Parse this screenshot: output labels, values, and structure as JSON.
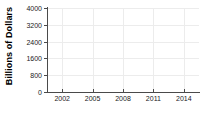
{
  "chart_data": {
    "type": "line",
    "title": "",
    "subtitle": "",
    "xlabel": "",
    "ylabel": "Billions of Dollars",
    "x_tick_labels": [
      "2002",
      "2005",
      "2008",
      "2011",
      "2014"
    ],
    "x_tick_values": [
      2002,
      2005,
      2008,
      2011,
      2014
    ],
    "y_tick_labels": [
      "0",
      "800",
      "1600",
      "2400",
      "3200",
      "4000"
    ],
    "y_tick_values": [
      0,
      800,
      1600,
      2400,
      3200,
      4000
    ],
    "xlim": [
      2000.5,
      2015.5
    ],
    "ylim": [
      0,
      4000
    ],
    "grid": true,
    "grid_color": "#ececec",
    "legend": null,
    "legend_position": "none",
    "series": [],
    "annotations": [],
    "axis_color": "#4a4a4a",
    "background_color": "#ffffff",
    "note": "Empty axes frame: gridlines and tick labels rendered, no data series drawn"
  }
}
